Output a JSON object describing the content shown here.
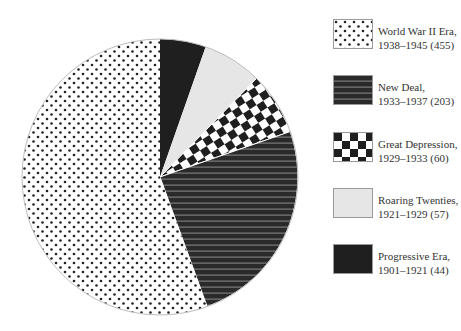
{
  "chart_data": {
    "type": "pie",
    "title": "",
    "start_angle": "12 o'clock",
    "direction": "clockwise",
    "legend_position": "right",
    "slices": [
      {
        "label": "Progressive Era",
        "period": "1901–1921",
        "value": 44,
        "pattern": "solid-dark",
        "color": "#1f1f1f"
      },
      {
        "label": "Roaring Twenties",
        "period": "1921–1929",
        "value": 57,
        "pattern": "solid-light",
        "color": "#e6e6e6"
      },
      {
        "label": "Great Depression",
        "period": "1929–1933",
        "value": 60,
        "pattern": "checkerboard",
        "color": "#1f1f1f"
      },
      {
        "label": "New Deal",
        "period": "1933–1937",
        "value": 203,
        "pattern": "horizontal-stripes",
        "color": "#2a2a2a"
      },
      {
        "label": "World War II Era",
        "period": "1938–1945",
        "value": 455,
        "pattern": "dots",
        "color": "#222222"
      }
    ],
    "total": 819
  },
  "legend": {
    "items": [
      {
        "line1": "World War II Era,",
        "line2": "1938–1945 (455)"
      },
      {
        "line1": "New Deal,",
        "line2": "1933–1937 (203)"
      },
      {
        "line1": "Great Depression,",
        "line2": "1929–1933 (60)"
      },
      {
        "line1": "Roaring Twenties,",
        "line2": "1921–1929 (57)"
      },
      {
        "line1": "Progressive Era,",
        "line2": "1901–1921 (44)"
      }
    ]
  }
}
